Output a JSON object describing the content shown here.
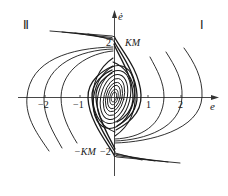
{
  "figure": {
    "type": "phase-plane portrait",
    "x_axis": {
      "label": "e",
      "ticks": [
        "-2",
        "-1",
        "1",
        "2"
      ]
    },
    "y_axis": {
      "label": "ė",
      "ticks": [
        "2",
        "-2"
      ]
    },
    "annotations": {
      "top_value": "KM",
      "bottom_value": "−KM",
      "quadrant_left": "Ⅱ",
      "quadrant_right": "Ⅰ"
    },
    "tick_labels": {
      "x_m2": "−2",
      "x_m1": "−1",
      "x_1": "1",
      "x_2": "2",
      "y_2": "2",
      "y_m2": "−2"
    },
    "colors": {
      "curve": "#1a1a1a",
      "axis": "#333333",
      "background": "#ffffff"
    }
  }
}
